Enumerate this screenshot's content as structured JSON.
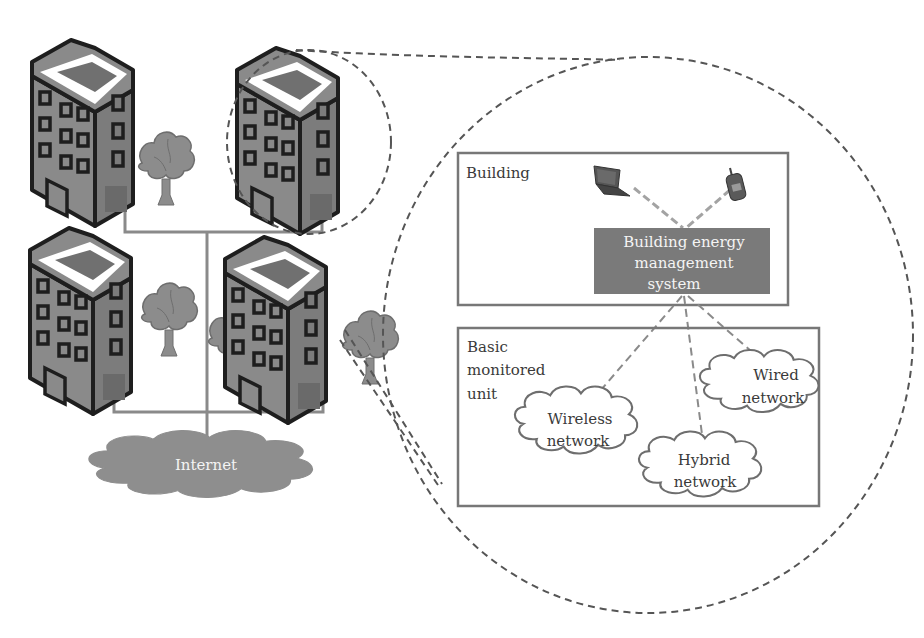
{
  "colors": {
    "building_body": "#8a8a8a",
    "building_outline": "#1e1e1e",
    "building_roof_rim": "#ffffff",
    "building_roof": "#707070",
    "tree": "#8c8c8c",
    "network_line": "#8a8a8a",
    "dashed_outline": "#555555",
    "internet_cloud": "#8e8e8e",
    "bems_box": "#7a7a7a",
    "panel_border": "#777777",
    "device_link": "#a3a3a3"
  },
  "campus": {
    "buildings": [
      {
        "id": "building-top-left"
      },
      {
        "id": "building-top-right-highlighted"
      },
      {
        "id": "building-bottom-left"
      },
      {
        "id": "building-bottom-right"
      }
    ],
    "trees": 4,
    "internet": {
      "label": "Internet"
    }
  },
  "detail": {
    "building_panel": {
      "label": "Building",
      "devices": [
        {
          "name": "laptop"
        },
        {
          "name": "mobile-phone"
        }
      ],
      "bems": {
        "lines": [
          "Building energy",
          "management",
          "system"
        ]
      }
    },
    "unit_panel": {
      "label_lines": [
        "Basic",
        "monitored",
        "unit"
      ],
      "networks": [
        {
          "id": "wireless",
          "lines": [
            "Wireless",
            "network"
          ]
        },
        {
          "id": "wired",
          "lines": [
            "Wired",
            "network"
          ]
        },
        {
          "id": "hybrid",
          "lines": [
            "Hybrid",
            "network"
          ]
        }
      ]
    }
  }
}
